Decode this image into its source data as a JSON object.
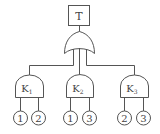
{
  "diagram": {
    "type": "fault-tree",
    "top_event": {
      "label": "T"
    },
    "top_gate": {
      "type": "OR"
    },
    "intermediate_gates": [
      {
        "id": "K1",
        "label": "K",
        "sub": "1",
        "type": "AND",
        "inputs": [
          "1",
          "2"
        ]
      },
      {
        "id": "K2",
        "label": "K",
        "sub": "2",
        "type": "AND",
        "inputs": [
          "1",
          "3"
        ]
      },
      {
        "id": "K3",
        "label": "K",
        "sub": "3",
        "type": "AND",
        "inputs": [
          "2",
          "3"
        ]
      }
    ]
  },
  "colors": {
    "line": "#555555",
    "background": "#ffffff"
  }
}
